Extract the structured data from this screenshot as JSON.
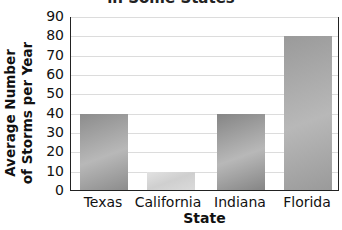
{
  "chart_data": {
    "type": "bar",
    "title": "in Some States",
    "xlabel": "State",
    "ylabel": "Average Number of Storms per Year",
    "ylabel_lines": [
      "Average Number",
      "of Storms per Year"
    ],
    "categories": [
      "Texas",
      "California",
      "Indiana",
      "Florida"
    ],
    "values": [
      40,
      10,
      40,
      80
    ],
    "ylim": [
      0,
      90
    ],
    "yticks": [
      0,
      10,
      20,
      30,
      40,
      50,
      60,
      70,
      80,
      90
    ],
    "grid": true,
    "legend": null,
    "bar_colors": [
      "#8c8c8c",
      "#d2d2d2",
      "#858585",
      "#9a9a9a"
    ]
  }
}
